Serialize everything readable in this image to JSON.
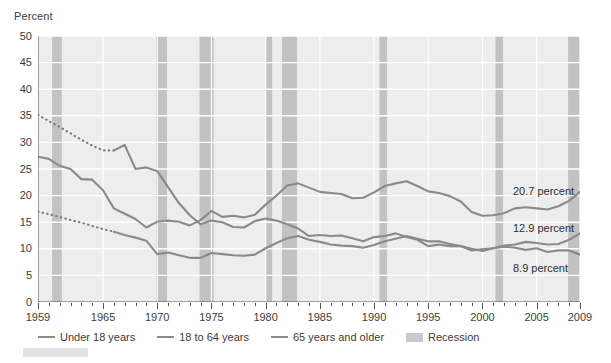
{
  "axis": {
    "y_title": "Percent",
    "y_ticks": [
      0,
      5,
      10,
      15,
      20,
      25,
      30,
      35,
      40,
      45,
      50
    ],
    "x_ticks": [
      {
        "label": "1959",
        "year": 1959
      },
      {
        "label": "1965",
        "year": 1965
      },
      {
        "label": "1970",
        "year": 1970
      },
      {
        "label": "1975",
        "year": 1975
      },
      {
        "label": "1980",
        "year": 1980
      },
      {
        "label": "1985",
        "year": 1985
      },
      {
        "label": "1990",
        "year": 1990
      },
      {
        "label": "1995",
        "year": 1995
      },
      {
        "label": "2000",
        "year": 2000
      },
      {
        "label": "2005",
        "year": 2005
      },
      {
        "label": "2009",
        "year": 2009
      }
    ]
  },
  "end_labels": [
    {
      "text": "20.7 percent",
      "series": "Under 18 years",
      "value": 20.7
    },
    {
      "text": "12.9 percent",
      "series": "18 to 64 years",
      "value": 12.9
    },
    {
      "text": "8.9 percent",
      "series": "65 years and older",
      "value": 8.9
    }
  ],
  "legend": {
    "items": [
      {
        "label": "Under 18 years",
        "marker": "line"
      },
      {
        "label": "18 to 64 years",
        "marker": "line"
      },
      {
        "label": "65 years and older",
        "marker": "line"
      },
      {
        "label": "Recession",
        "marker": "swatch"
      }
    ]
  },
  "colors": {
    "line": "#8a8a8a",
    "line_dark": "#7b7b7b",
    "recession_band": "#c2c2c2",
    "plot_background": "#ededed",
    "gridline": "#ffffff",
    "axis": "#555555",
    "text": "#3d3d3d"
  },
  "chart_data": {
    "type": "line",
    "title": "",
    "xlabel": "",
    "ylabel": "Percent",
    "xlim": [
      1959,
      2009
    ],
    "ylim": [
      0,
      50
    ],
    "grid": true,
    "legend_position": "bottom",
    "x": [
      1959,
      1960,
      1961,
      1962,
      1963,
      1964,
      1965,
      1966,
      1967,
      1968,
      1969,
      1970,
      1971,
      1972,
      1973,
      1974,
      1975,
      1976,
      1977,
      1978,
      1979,
      1980,
      1981,
      1982,
      1983,
      1984,
      1985,
      1986,
      1987,
      1988,
      1989,
      1990,
      1991,
      1992,
      1993,
      1994,
      1995,
      1996,
      1997,
      1998,
      1999,
      2000,
      2001,
      2002,
      2003,
      2004,
      2005,
      2006,
      2007,
      2008,
      2009
    ],
    "series": [
      {
        "name": "Under 18 years",
        "values": [
          27.3,
          26.9,
          25.6,
          25.0,
          23.1,
          23.0,
          21.0,
          17.6,
          16.6,
          15.6,
          14.0,
          15.1,
          15.3,
          15.1,
          14.4,
          15.4,
          17.1,
          16.0,
          16.2,
          15.9,
          16.4,
          18.3,
          20.0,
          21.9,
          22.3,
          21.5,
          20.7,
          20.5,
          20.3,
          19.5,
          19.6,
          20.6,
          21.8,
          22.3,
          22.7,
          21.8,
          20.8,
          20.5,
          19.9,
          18.9,
          16.9,
          16.2,
          16.3,
          16.7,
          17.6,
          17.8,
          17.6,
          17.4,
          18.0,
          19.0,
          20.7
        ],
        "style": "solid"
      },
      {
        "name": "18 to 64 years",
        "values": [
          17.0,
          16.5,
          16.0,
          15.4,
          14.9,
          14.3,
          13.7,
          13.2,
          12.6,
          12.1,
          11.5,
          9.0,
          9.3,
          8.8,
          8.3,
          8.3,
          9.2,
          9.0,
          8.8,
          8.7,
          8.9,
          10.1,
          11.1,
          12.0,
          12.4,
          11.7,
          11.3,
          10.8,
          10.6,
          10.5,
          10.2,
          10.7,
          11.4,
          11.9,
          12.4,
          11.9,
          11.4,
          11.4,
          10.9,
          10.5,
          10.0,
          9.6,
          10.1,
          10.6,
          10.8,
          11.3,
          11.1,
          10.8,
          10.9,
          11.7,
          12.9
        ],
        "style": "dotted_1959_1966_then_solid"
      },
      {
        "name": "65 years and older",
        "values": [
          35.2,
          34.0,
          32.9,
          31.7,
          30.5,
          29.4,
          28.5,
          28.5,
          29.5,
          25.0,
          25.3,
          24.6,
          21.6,
          18.6,
          16.3,
          14.6,
          15.3,
          15.0,
          14.1,
          14.0,
          15.2,
          15.7,
          15.3,
          14.6,
          13.8,
          12.4,
          12.6,
          12.4,
          12.5,
          12.0,
          11.4,
          12.2,
          12.4,
          12.9,
          12.2,
          11.7,
          10.5,
          10.8,
          10.5,
          10.5,
          9.7,
          9.9,
          10.1,
          10.4,
          10.2,
          9.8,
          10.1,
          9.4,
          9.7,
          9.7,
          8.9
        ],
        "style": "dotted_1959_1966_then_solid"
      }
    ],
    "recessions": [
      {
        "start": 1960.3,
        "end": 1961.2
      },
      {
        "start": 1969.9,
        "end": 1970.9
      },
      {
        "start": 1973.9,
        "end": 1975.2
      },
      {
        "start": 1980.0,
        "end": 1980.6
      },
      {
        "start": 1981.5,
        "end": 1982.9
      },
      {
        "start": 1990.5,
        "end": 1991.2
      },
      {
        "start": 2001.2,
        "end": 2001.9
      },
      {
        "start": 2007.9,
        "end": 2009.5
      }
    ]
  }
}
